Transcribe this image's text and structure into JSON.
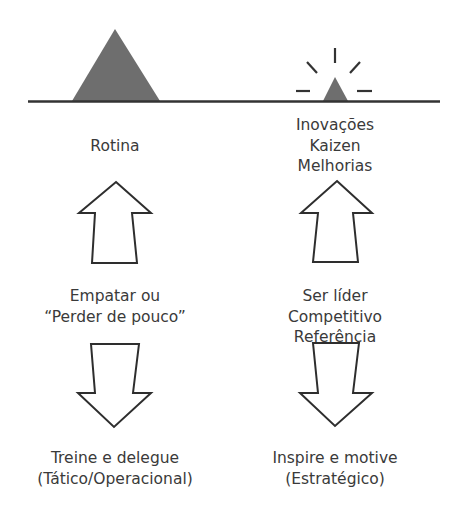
{
  "colors": {
    "shape_fill": "#6e6e6e",
    "line": "#333333",
    "arrow_stroke": "#2e2e2e",
    "text": "#3a3a3a",
    "background": "#ffffff"
  },
  "left_column": {
    "top_label": [
      "Rotina"
    ],
    "middle_label": [
      "Empatar ou",
      "“Perder de pouco”"
    ],
    "bottom_label": [
      "Treine e delegue",
      "(Tático/Operacional)"
    ],
    "shape": "large-triangle"
  },
  "right_column": {
    "top_label": [
      "Inovações",
      "Kaizen",
      "Melhorias"
    ],
    "middle_label": [
      "Ser líder",
      "Competitivo",
      "Referência"
    ],
    "bottom_label": [
      "Inspire e motive",
      "(Estratégico)"
    ],
    "shape": "small-triangle-with-rays"
  }
}
